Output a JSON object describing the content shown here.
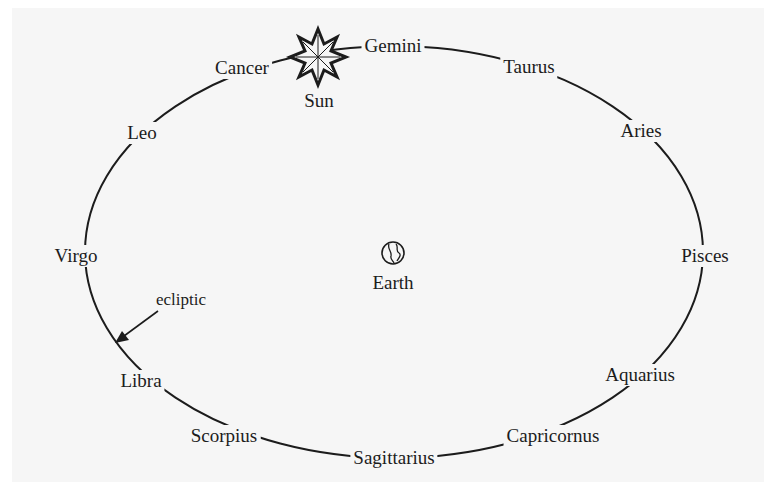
{
  "diagram": {
    "title": "",
    "center_object": {
      "label": "Earth",
      "icon": "globe-icon"
    },
    "sun": {
      "label": "Sun",
      "icon": "sun-star-icon"
    },
    "ecliptic_label": "ecliptic",
    "constellations": [
      {
        "name": "Gemini",
        "x": 393,
        "y": 46
      },
      {
        "name": "Taurus",
        "x": 529,
        "y": 67
      },
      {
        "name": "Aries",
        "x": 641,
        "y": 131
      },
      {
        "name": "Pisces",
        "x": 705,
        "y": 256
      },
      {
        "name": "Aquarius",
        "x": 640,
        "y": 375
      },
      {
        "name": "Capricornus",
        "x": 553,
        "y": 436
      },
      {
        "name": "Sagittarius",
        "x": 394,
        "y": 458
      },
      {
        "name": "Scorpius",
        "x": 224,
        "y": 436
      },
      {
        "name": "Libra",
        "x": 141,
        "y": 381
      },
      {
        "name": "Virgo",
        "x": 76,
        "y": 256
      },
      {
        "name": "Leo",
        "x": 142,
        "y": 133
      },
      {
        "name": "Cancer",
        "x": 242,
        "y": 68
      }
    ],
    "colors": {
      "background": "#f6f6f6",
      "ink": "#1c1c1c"
    }
  }
}
